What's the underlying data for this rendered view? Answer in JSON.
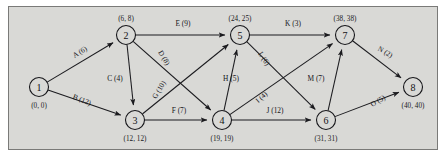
{
  "figure": {
    "kind": "activity-on-arc-network-diagram",
    "background_color": "#d9d9d6",
    "border_color": "#7a7a78",
    "line_color": "#1b1b1f"
  },
  "chart_data": {
    "type": "diagram",
    "title": "",
    "nodes": [
      {
        "id": "1",
        "label": "1",
        "times": "(0, 0)",
        "x": 30,
        "y": 80,
        "times_dx": 0,
        "times_dy": 21
      },
      {
        "id": "2",
        "label": "2",
        "times": "(6, 8)",
        "x": 117,
        "y": 28,
        "times_dx": 0,
        "times_dy": -14
      },
      {
        "id": "3",
        "label": "3",
        "times": "(12, 12)",
        "x": 126,
        "y": 113,
        "times_dx": 0,
        "times_dy": 21
      },
      {
        "id": "4",
        "label": "4",
        "times": "(19, 19)",
        "x": 213,
        "y": 113,
        "times_dx": 0,
        "times_dy": 21
      },
      {
        "id": "5",
        "label": "5",
        "times": "(24, 25)",
        "x": 231,
        "y": 28,
        "times_dx": 0,
        "times_dy": -14
      },
      {
        "id": "6",
        "label": "6",
        "times": "(31, 31)",
        "x": 317,
        "y": 113,
        "times_dx": 0,
        "times_dy": 21
      },
      {
        "id": "7",
        "label": "7",
        "times": "(38, 38)",
        "x": 336,
        "y": 28,
        "times_dx": 0,
        "times_dy": -14
      },
      {
        "id": "8",
        "label": "8",
        "times": "(40, 40)",
        "x": 404,
        "y": 80,
        "times_dx": 0,
        "times_dy": 21
      }
    ],
    "edges": [
      {
        "id": "A",
        "label": "A (6)",
        "from": "1",
        "to": "2",
        "duration": 6,
        "lx": 72,
        "ly": 47,
        "rot": -31
      },
      {
        "id": "B",
        "label": "B (12)",
        "from": "1",
        "to": "3",
        "duration": 12,
        "lx": 72,
        "ly": 95,
        "rot": 22
      },
      {
        "id": "C",
        "label": "C (4)",
        "from": "2",
        "to": "3",
        "duration": 4,
        "lx": 106,
        "ly": 74,
        "rot": 0
      },
      {
        "id": "D",
        "label": "D (8)",
        "from": "2",
        "to": "4",
        "duration": 8,
        "lx": 153,
        "ly": 52,
        "rot": 59
      },
      {
        "id": "E",
        "label": "E (9)",
        "from": "2",
        "to": "5",
        "duration": 9,
        "lx": 174,
        "ly": 19,
        "rot": 0
      },
      {
        "id": "F",
        "label": "F (7)",
        "from": "3",
        "to": "4",
        "duration": 7,
        "lx": 170,
        "ly": 106,
        "rot": 0
      },
      {
        "id": "G",
        "label": "G (10)",
        "from": "3",
        "to": "5",
        "duration": 10,
        "lx": 152,
        "ly": 84,
        "rot": -59
      },
      {
        "id": "H",
        "label": "H (5)",
        "from": "4",
        "to": "5",
        "duration": 5,
        "lx": 222,
        "ly": 74,
        "rot": 0
      },
      {
        "id": "I",
        "label": "I (4)",
        "from": "4",
        "to": "7",
        "duration": 4,
        "lx": 254,
        "ly": 92,
        "rot": -42
      },
      {
        "id": "J",
        "label": "J (12)",
        "from": "4",
        "to": "6",
        "duration": 12,
        "lx": 266,
        "ly": 106,
        "rot": 0
      },
      {
        "id": "K",
        "label": "K (3)",
        "from": "5",
        "to": "7",
        "duration": 3,
        "lx": 284,
        "ly": 19,
        "rot": 0
      },
      {
        "id": "L",
        "label": "L (6)",
        "from": "5",
        "to": "6",
        "duration": 6,
        "lx": 253,
        "ly": 53,
        "rot": 57
      },
      {
        "id": "M",
        "label": "M (7)",
        "from": "6",
        "to": "7",
        "duration": 7,
        "lx": 307,
        "ly": 74,
        "rot": 0
      },
      {
        "id": "N",
        "label": "N (2)",
        "from": "7",
        "to": "8",
        "duration": 2,
        "lx": 375,
        "ly": 47,
        "rot": 30
      },
      {
        "id": "O",
        "label": "O (5)",
        "from": "6",
        "to": "8",
        "duration": 5,
        "lx": 370,
        "ly": 96,
        "rot": -30
      }
    ]
  }
}
